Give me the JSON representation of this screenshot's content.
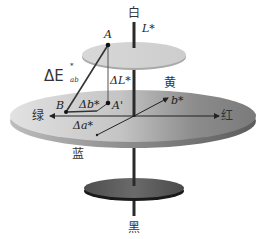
{
  "diagram": {
    "poles": {
      "white": "白",
      "black": "黑"
    },
    "hues": {
      "yellow": "黄",
      "red": "红",
      "green": "绿",
      "blue": "蓝"
    },
    "axes": {
      "lightness": "L*",
      "b_axis": "b*"
    },
    "points": {
      "A": "A",
      "A_prime": "A'",
      "B": "B"
    },
    "deltas": {
      "delta_E_main": "ΔE",
      "delta_E_sub": "ab",
      "delta_E_sup": "*",
      "delta_L": "ΔL*",
      "delta_b": "Δb*",
      "delta_a": "Δa*"
    },
    "colors": {
      "axis": "#2a2a2a",
      "top_disc": "#d4d4d4",
      "big_disc_light": "#d9d9d9",
      "big_disc_dark": "#6e6e6e",
      "bottom_disc": "#5a5a5a"
    }
  }
}
